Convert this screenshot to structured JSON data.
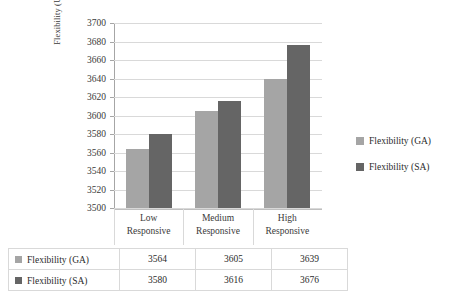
{
  "chart_data": {
    "type": "bar",
    "title": "",
    "xlabel": "",
    "ylabel": "Flexibility (Units)",
    "categories": [
      "Low Responsive",
      "Medium Responsive",
      "High Responsive"
    ],
    "category_lines": [
      [
        "Low",
        "Responsive"
      ],
      [
        "Medium",
        "Responsive"
      ],
      [
        "High",
        "Responsive"
      ]
    ],
    "series": [
      {
        "name": "Flexibility (GA)",
        "color": "#a5a5a5",
        "values": [
          3564,
          3605,
          3639
        ]
      },
      {
        "name": "Flexibility (SA)",
        "color": "#656565",
        "values": [
          3580,
          3616,
          3676
        ]
      }
    ],
    "ylim": [
      3500,
      3700
    ],
    "ytick_step": 20,
    "yticks": [
      3700,
      3680,
      3660,
      3640,
      3620,
      3600,
      3580,
      3560,
      3540,
      3520,
      3500
    ],
    "ytick_labels": [
      "3700",
      "3680",
      "3660",
      "3640",
      "3620",
      "3600",
      "3580",
      "3560",
      "3540",
      "3520",
      "3500"
    ],
    "grid": true,
    "legend_position": "right",
    "legend": [
      "Flexibility (GA)",
      "Flexibility (SA)"
    ]
  },
  "table": {
    "rows": [
      {
        "label": "Flexibility (GA)",
        "swatch": "ga",
        "values": [
          "3564",
          "3605",
          "3639"
        ]
      },
      {
        "label": "Flexibility (SA)",
        "swatch": "sa",
        "values": [
          "3580",
          "3616",
          "3676"
        ]
      }
    ]
  },
  "colors": {
    "series_ga": "#a5a5a5",
    "series_sa": "#656565",
    "gridline": "#d9d9d9",
    "axis": "#a6a6a6",
    "text": "#2b2b2b"
  }
}
